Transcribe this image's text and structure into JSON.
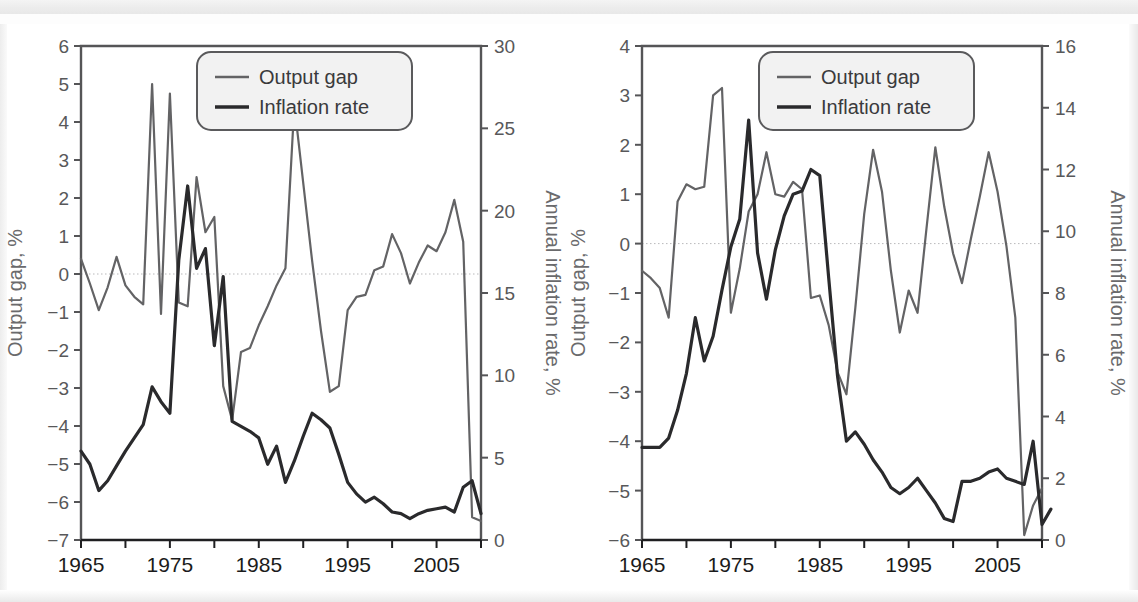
{
  "figures": [
    {
      "id": "left",
      "legend": {
        "output_gap": "Output gap",
        "inflation": "Inflation rate"
      },
      "chart_data": {
        "type": "line",
        "title": "",
        "xlabel": "",
        "ylabel": "Output gap, %",
        "y2label": "Annual inflation rate, %",
        "xlim": [
          1965,
          2010
        ],
        "ylim": [
          -7,
          6
        ],
        "y2lim": [
          0,
          30
        ],
        "xticks": [
          1965,
          1975,
          1985,
          1995,
          2005
        ],
        "xticks_minor": [
          1970,
          1980,
          1990,
          2000,
          2010
        ],
        "yticks": [
          -7,
          -6,
          -5,
          -4,
          -3,
          -2,
          -1,
          0,
          1,
          2,
          3,
          4,
          5,
          6
        ],
        "yticklabels": [
          "−7",
          "−6",
          "−5",
          "−4",
          "−3",
          "−2",
          "−1",
          "0",
          "1",
          "2",
          "3",
          "4",
          "5",
          "6"
        ],
        "y2ticks": [
          0,
          5,
          10,
          15,
          20,
          25,
          30
        ],
        "grid": false,
        "zero_line": true,
        "legend_position": "top-right",
        "x": [
          1965,
          1966,
          1967,
          1968,
          1969,
          1970,
          1971,
          1972,
          1973,
          1974,
          1975,
          1976,
          1977,
          1978,
          1979,
          1980,
          1981,
          1982,
          1983,
          1984,
          1985,
          1986,
          1987,
          1988,
          1989,
          1990,
          1991,
          1992,
          1993,
          1994,
          1995,
          1996,
          1997,
          1998,
          1999,
          2000,
          2001,
          2002,
          2003,
          2004,
          2005,
          2006,
          2007,
          2008,
          2009,
          2010
        ],
        "series": [
          {
            "name": "Output gap",
            "axis": "left",
            "color": "#636365",
            "width": 2.2,
            "values": [
              0.4,
              -0.25,
              -0.95,
              -0.35,
              0.45,
              -0.3,
              -0.6,
              -0.8,
              5.0,
              -1.05,
              4.75,
              -0.75,
              -0.85,
              2.55,
              1.1,
              1.5,
              -2.95,
              -3.85,
              -2.05,
              -1.95,
              -1.35,
              -0.85,
              -0.3,
              0.15,
              4.45,
              2.4,
              0.35,
              -1.5,
              -3.1,
              -2.95,
              -0.95,
              -0.6,
              -0.55,
              0.1,
              0.2,
              1.05,
              0.55,
              -0.25,
              0.3,
              0.75,
              0.6,
              1.1,
              1.95,
              0.85,
              -6.4,
              -6.5
            ]
          },
          {
            "name": "Inflation rate",
            "axis": "right",
            "color": "#2a2a2c",
            "width": 3.2,
            "values": [
              5.4,
              4.6,
              3.0,
              3.6,
              4.5,
              5.4,
              6.2,
              7.0,
              9.3,
              8.4,
              7.7,
              17.0,
              21.5,
              16.5,
              17.7,
              11.8,
              16.0,
              7.2,
              6.9,
              6.6,
              6.2,
              4.6,
              5.7,
              3.5,
              4.8,
              6.3,
              7.7,
              7.3,
              6.8,
              5.2,
              3.5,
              2.8,
              2.3,
              2.6,
              2.2,
              1.7,
              1.6,
              1.3,
              1.6,
              1.8,
              1.9,
              2.0,
              1.7,
              3.2,
              3.6,
              1.6
            ]
          }
        ]
      }
    },
    {
      "id": "right",
      "legend": {
        "output_gap": "Output gap",
        "inflation": "Inflation rate"
      },
      "chart_data": {
        "type": "line",
        "title": "",
        "xlabel": "",
        "ylabel": "Output gap, %",
        "y2label": "Annual inflation rate, %",
        "xlim": [
          1965,
          2010
        ],
        "ylim": [
          -6,
          4
        ],
        "y2lim": [
          0,
          16
        ],
        "xticks": [
          1965,
          1975,
          1985,
          1995,
          2005
        ],
        "xticks_minor": [
          1970,
          1980,
          1990,
          2000,
          2010
        ],
        "yticks": [
          -6,
          -5,
          -4,
          -3,
          -2,
          -1,
          0,
          1,
          2,
          3,
          4
        ],
        "yticklabels": [
          "−6",
          "−5",
          "−4",
          "−3",
          "−2",
          "−1",
          "0",
          "1",
          "2",
          "3",
          "4"
        ],
        "y2ticks": [
          0,
          2,
          4,
          6,
          8,
          10,
          12,
          14,
          16
        ],
        "grid": false,
        "zero_line": true,
        "legend_position": "top-right",
        "x": [
          1965,
          1966,
          1967,
          1968,
          1969,
          1970,
          1971,
          1972,
          1973,
          1974,
          1975,
          1976,
          1977,
          1978,
          1979,
          1980,
          1981,
          1982,
          1983,
          1984,
          1985,
          1986,
          1987,
          1988,
          1989,
          1990,
          1991,
          1992,
          1993,
          1994,
          1995,
          1996,
          1997,
          1998,
          1999,
          2000,
          2001,
          2002,
          2003,
          2004,
          2005,
          2006,
          2007,
          2008,
          2009,
          2010
        ],
        "series": [
          {
            "name": "Output gap",
            "axis": "left",
            "color": "#636365",
            "width": 2.2,
            "values": [
              -0.55,
              -0.7,
              -0.9,
              -1.5,
              0.85,
              1.2,
              1.1,
              1.15,
              3.0,
              3.15,
              -1.4,
              -0.5,
              0.65,
              1.0,
              1.85,
              1.0,
              0.95,
              1.25,
              1.1,
              -1.1,
              -1.05,
              -1.65,
              -2.6,
              -3.05,
              -1.3,
              0.6,
              1.9,
              1.05,
              -0.55,
              -1.8,
              -0.95,
              -1.4,
              0.3,
              1.95,
              0.75,
              -0.2,
              -0.8,
              0.1,
              0.95,
              1.85,
              1.05,
              -0.05,
              -1.5,
              -5.9,
              -5.3,
              -4.95
            ]
          },
          {
            "name": "Inflation rate",
            "axis": "right",
            "color": "#2a2a2c",
            "width": 3.2,
            "values": [
              3.0,
              3.0,
              3.0,
              3.3,
              4.2,
              5.4,
              7.2,
              5.8,
              6.6,
              8.1,
              9.5,
              10.4,
              13.6,
              9.3,
              7.8,
              9.4,
              10.5,
              11.2,
              11.3,
              12.0,
              11.8,
              8.5,
              5.3,
              3.2,
              3.5,
              3.1,
              2.6,
              2.2,
              1.7,
              1.5,
              1.7,
              2.0,
              1.6,
              1.2,
              0.7,
              0.6,
              1.9,
              1.9,
              2.0,
              2.2,
              2.3,
              2.0,
              1.9,
              1.8,
              3.2,
              0.5,
              1.0
            ]
          }
        ]
      }
    }
  ]
}
